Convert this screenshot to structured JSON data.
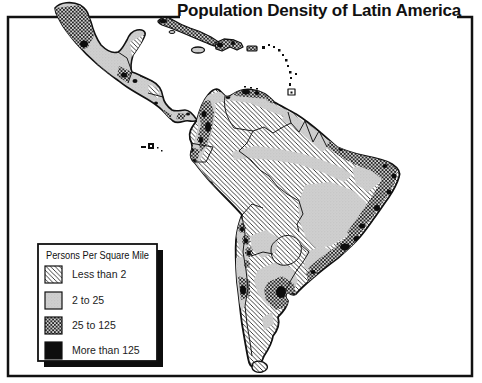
{
  "title": "Population Density of Latin America",
  "legend": {
    "title": "Persons Per Square Mile",
    "items": [
      {
        "label": "Less than 2",
        "pattern": "diagonal-hatch"
      },
      {
        "label": "2 to 25",
        "pattern": "light-gray-stipple"
      },
      {
        "label": "25 to 125",
        "pattern": "dark-halftone"
      },
      {
        "label": "More than 125",
        "pattern": "solid-black"
      }
    ]
  },
  "map": {
    "features": [
      "Mexico",
      "Central America",
      "Cuba",
      "Jamaica",
      "Hispaniola",
      "Puerto Rico",
      "Lesser Antilles",
      "Galapagos Islands",
      "South America",
      "Tierra del Fuego"
    ]
  },
  "colors": {
    "ink": "#111111",
    "paper": "#ffffff",
    "light_gray": "#cfcfcf"
  }
}
